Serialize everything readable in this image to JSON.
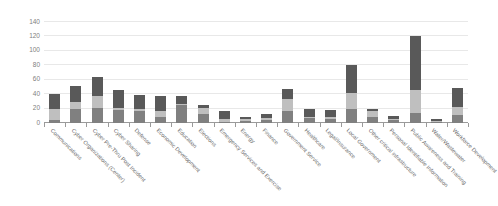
{
  "chart_data": {
    "type": "bar",
    "stacked": true,
    "title": "",
    "subtitle": "",
    "xlabel": "",
    "ylabel": "",
    "ylim": [
      0,
      140
    ],
    "ytick_step": 20,
    "yticks": [
      0,
      20,
      40,
      60,
      80,
      100,
      120,
      140
    ],
    "ytick_labels": [
      "0",
      "20",
      "40",
      "60",
      "80",
      "100",
      "120",
      "140"
    ],
    "grid": true,
    "grid_axis": "y",
    "legend": false,
    "legend_position": "none",
    "colors": {
      "series_1": "#808080",
      "series_2": "#bfbfbf",
      "series_3": "#595959",
      "gridline": "#e8e8e8",
      "axis": "#9a9a9a",
      "label_text": "#6b6b6b",
      "background": "#ffffff"
    },
    "categories": [
      "Communications",
      "Cyber Organizations (Center)",
      "Cyber Pre-Thru Post Incident",
      "Cyber Sharing",
      "Defense",
      "Economic Development",
      "Education",
      "Elections",
      "Emergency Services and Exercise",
      "Energy",
      "Finance",
      "Government Service",
      "Healthcare",
      "Legal/Insurance",
      "Local Government",
      "Other critical infrastructure",
      "Personal Identifiable Information",
      "Public Awareness and Training",
      "Water/Wastewater",
      "Workforce Development"
    ],
    "series": [
      {
        "name": "series_1",
        "color": "#808080",
        "values": [
          4,
          20,
          21,
          18,
          17,
          8,
          25,
          13,
          2,
          3,
          4,
          16,
          7,
          6,
          19,
          8,
          4,
          14,
          2,
          11
        ]
      },
      {
        "name": "series_2",
        "color": "#bfbfbf",
        "values": [
          16,
          9,
          16,
          3,
          3,
          9,
          2,
          8,
          4,
          2,
          3,
          17,
          2,
          3,
          23,
          8,
          2,
          32,
          1,
          11
        ]
      },
      {
        "name": "series_3",
        "color": "#595959",
        "values": [
          20,
          22,
          27,
          25,
          19,
          21,
          11,
          4,
          10,
          4,
          5,
          14,
          11,
          9,
          38,
          4,
          4,
          74,
          2,
          26
        ]
      }
    ],
    "totals": [
      40,
      51,
      64,
      46,
      39,
      38,
      38,
      25,
      16,
      9,
      12,
      47,
      20,
      18,
      80,
      20,
      10,
      120,
      5,
      48
    ]
  }
}
